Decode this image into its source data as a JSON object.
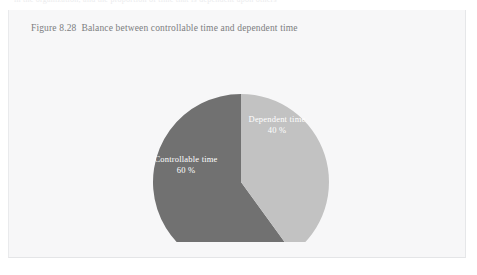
{
  "page": {
    "bleed_text": "in the organization, and the proportion of time that is dependent upon others"
  },
  "figure": {
    "caption_number": "Figure 8.28",
    "caption_text": "Balance between controllable time and dependent time"
  },
  "chart_data": {
    "type": "pie",
    "title": "Balance between controllable time and dependent time",
    "categories": [
      "Dependent time",
      "Controllable time"
    ],
    "values": [
      40,
      60
    ],
    "value_labels": [
      "40 %",
      "60 %"
    ],
    "unit": "%",
    "start_angle_deg": 0,
    "direction": "clockwise",
    "legend": "none",
    "grid": false,
    "series": [
      {
        "name": "Dependent time",
        "value": 40,
        "value_label": "40 %",
        "color": "#c2c2c2",
        "label_color": "#ffffff"
      },
      {
        "name": "Controllable time",
        "value": 60,
        "value_label": "60 %",
        "color": "#717171",
        "label_color": "#ffffff"
      }
    ],
    "geometry": {
      "center_x": 232,
      "center_y": 140,
      "radius": 88
    }
  },
  "colors": {
    "page_background": "#ffffff",
    "card_background": "#f7f7f8",
    "card_border": "#e7e8ea",
    "caption_text": "#7c7d80",
    "slice_dark": "#717171",
    "slice_light": "#c2c2c2",
    "label_text": "#ffffff"
  }
}
